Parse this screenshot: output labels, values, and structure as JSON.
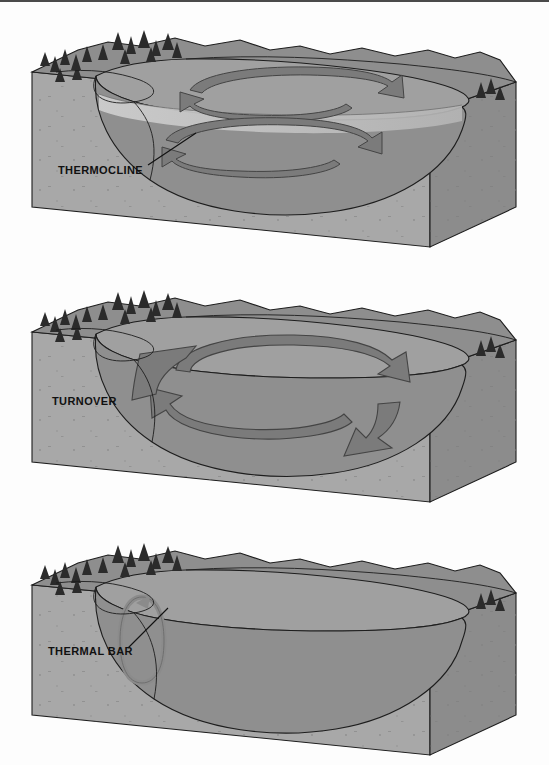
{
  "figure": {
    "frame": {
      "border_color": "#4a4a4a",
      "background": "#fdfdfd"
    },
    "width": 549,
    "height": 765
  },
  "palette": {
    "sediment_top": "#9a9a9a",
    "sediment_front": "#a8a8a8",
    "sediment_side": "#8c8c8c",
    "land_surface": "#8e8e8e",
    "water_upper": "#a0a0a0",
    "water_deep": "#8f8f8f",
    "thermocline_band": "#c3c3c3",
    "arrow_fill": "#7b7b7b",
    "arrow_dark": "#6a6a6a",
    "tree_color": "#2b2b2b",
    "outline": "#1d1d1d",
    "label_color": "#111111"
  },
  "panels": [
    {
      "id": "thermocline",
      "label": "THERMOCLINE",
      "label_x": 58,
      "label_y": 172,
      "has_leader_line": true,
      "leader": {
        "x1": 148,
        "y1": 163,
        "x2": 196,
        "y2": 131
      },
      "description": "Summer stratification: a light thermocline band separates an upper circulation cell from a lower circulation cell",
      "circulation_cells": 2,
      "tree_clusters": [
        {
          "x": 60,
          "y": 60,
          "count": 7
        },
        {
          "x": 112,
          "y": 48,
          "count": 9
        },
        {
          "x": 482,
          "y": 90,
          "count": 3
        }
      ]
    },
    {
      "id": "turnover",
      "label": "TURNOVER",
      "label_x": 52,
      "label_y": 405,
      "has_leader_line": false,
      "leader": null,
      "description": "Turnover: one large full-depth circulation cell mixes the whole water column",
      "circulation_cells": 1,
      "tree_clusters": [
        {
          "x": 60,
          "y": 60,
          "count": 7
        },
        {
          "x": 112,
          "y": 48,
          "count": 9
        },
        {
          "x": 482,
          "y": 90,
          "count": 3
        }
      ]
    },
    {
      "id": "thermal-bar",
      "label": "THERMAL BAR",
      "label_x": 48,
      "label_y": 655,
      "has_leader_line": true,
      "leader": {
        "x1": 128,
        "y1": 648,
        "x2": 168,
        "y2": 608
      },
      "description": "Thermal bar: a narrow vertical circulation cell near the shoreline, no basin-wide mixing",
      "circulation_cells": 1,
      "tree_clusters": [
        {
          "x": 60,
          "y": 60,
          "count": 7
        },
        {
          "x": 112,
          "y": 48,
          "count": 9
        },
        {
          "x": 482,
          "y": 90,
          "count": 3
        }
      ]
    }
  ]
}
